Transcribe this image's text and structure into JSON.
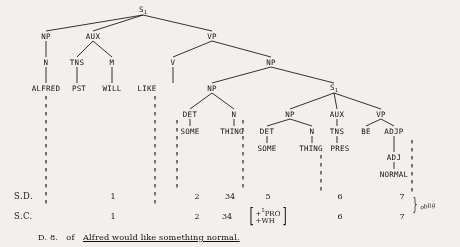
{
  "document": {
    "caption_prefix": "D. 8.",
    "caption_connector": "of",
    "caption_sentence": "Alfred would like something normal.",
    "page_bg": "#f2f0ec",
    "ink": "#15120f"
  },
  "tree": {
    "root_label": "S",
    "root_subscript": "1",
    "nodes": [
      {
        "id": "S_top",
        "label": "S",
        "sub": "1",
        "x": 143,
        "y": 10
      },
      {
        "id": "NP_subj",
        "label": "NP",
        "sub": "",
        "x": 46,
        "y": 36
      },
      {
        "id": "AUX_main",
        "label": "AUX",
        "sub": "",
        "x": 93,
        "y": 36
      },
      {
        "id": "VP_main",
        "label": "VP",
        "sub": "",
        "x": 212,
        "y": 36
      },
      {
        "id": "N_subj",
        "label": "N",
        "sub": "",
        "x": 46,
        "y": 62
      },
      {
        "id": "TNS_main",
        "label": "TNS",
        "sub": "",
        "x": 77,
        "y": 62
      },
      {
        "id": "M_main",
        "label": "M",
        "sub": "",
        "x": 112,
        "y": 62
      },
      {
        "id": "V_main",
        "label": "V",
        "sub": "",
        "x": 173,
        "y": 62
      },
      {
        "id": "NP_obj",
        "label": "NP",
        "sub": "",
        "x": 271,
        "y": 62
      },
      {
        "id": "NP_inner",
        "label": "NP",
        "sub": "",
        "x": 212,
        "y": 88
      },
      {
        "id": "S_emb",
        "label": "S",
        "sub": "1",
        "x": 334,
        "y": 88
      },
      {
        "id": "DET_1",
        "label": "DET",
        "sub": "",
        "x": 190,
        "y": 114
      },
      {
        "id": "N_1",
        "label": "N",
        "sub": "",
        "x": 234,
        "y": 114
      },
      {
        "id": "NP_emb",
        "label": "NP",
        "sub": "",
        "x": 290,
        "y": 114
      },
      {
        "id": "AUX_emb",
        "label": "AUX",
        "sub": "",
        "x": 337,
        "y": 114
      },
      {
        "id": "VP_emb",
        "label": "VP",
        "sub": "",
        "x": 381,
        "y": 114
      },
      {
        "id": "DET_2",
        "label": "DET",
        "sub": "",
        "x": 267,
        "y": 131
      },
      {
        "id": "N_2",
        "label": "N",
        "sub": "",
        "x": 312,
        "y": 131
      },
      {
        "id": "TNS_emb",
        "label": "TNS",
        "sub": "",
        "x": 337,
        "y": 131
      },
      {
        "id": "BE_emb",
        "label": "BE",
        "sub": "",
        "x": 366,
        "y": 131
      },
      {
        "id": "ADJP_emb",
        "label": "ADJP",
        "sub": "",
        "x": 394,
        "y": 131
      },
      {
        "id": "ADJ_emb",
        "label": "ADJ",
        "sub": "",
        "x": 394,
        "y": 157
      }
    ],
    "edges": [
      [
        "S_top",
        "NP_subj"
      ],
      [
        "S_top",
        "AUX_main"
      ],
      [
        "S_top",
        "VP_main"
      ],
      [
        "NP_subj",
        "N_subj"
      ],
      [
        "AUX_main",
        "TNS_main"
      ],
      [
        "AUX_main",
        "M_main"
      ],
      [
        "VP_main",
        "V_main"
      ],
      [
        "VP_main",
        "NP_obj"
      ],
      [
        "NP_obj",
        "NP_inner"
      ],
      [
        "NP_obj",
        "S_emb"
      ],
      [
        "NP_inner",
        "DET_1"
      ],
      [
        "NP_inner",
        "N_1"
      ],
      [
        "S_emb",
        "NP_emb"
      ],
      [
        "S_emb",
        "AUX_emb"
      ],
      [
        "S_emb",
        "VP_emb"
      ],
      [
        "NP_emb",
        "DET_2"
      ],
      [
        "NP_emb",
        "N_2"
      ],
      [
        "AUX_emb",
        "TNS_emb"
      ],
      [
        "VP_emb",
        "BE_emb"
      ],
      [
        "VP_emb",
        "ADJP_emb"
      ],
      [
        "ADJP_emb",
        "ADJ_emb"
      ]
    ],
    "terminals": [
      {
        "id": "t_alfred",
        "label": "ALFRED",
        "x": 46,
        "y": 88,
        "parent": "N_subj"
      },
      {
        "id": "t_pst",
        "label": "PST",
        "x": 79,
        "y": 88,
        "parent": "TNS_main"
      },
      {
        "id": "t_will",
        "label": "WILL",
        "x": 112,
        "y": 88,
        "parent": "M_main"
      },
      {
        "id": "t_like",
        "label": "LIKE",
        "x": 147,
        "y": 88,
        "parent": "V_main"
      },
      {
        "id": "t_some1",
        "label": "SOME",
        "x": 190,
        "y": 131,
        "parent": "DET_1"
      },
      {
        "id": "t_thing1",
        "label": "THING",
        "x": 232,
        "y": 131,
        "parent": "N_1"
      },
      {
        "id": "t_some2",
        "label": "SOME",
        "x": 267,
        "y": 148,
        "parent": "DET_2"
      },
      {
        "id": "t_thing2",
        "label": "THING",
        "x": 311,
        "y": 148,
        "parent": "N_2"
      },
      {
        "id": "t_pres",
        "label": "PRES",
        "x": 340,
        "y": 148,
        "parent": "TNS_emb"
      },
      {
        "id": "t_normal",
        "label": "NORMAL",
        "x": 394,
        "y": 174,
        "parent": "ADJ_emb"
      }
    ]
  },
  "analysis": {
    "sd": {
      "label": "S.D.",
      "label_x": 14,
      "y": 196,
      "cells": [
        {
          "id": "sd_1",
          "text": "1",
          "x": 113
        },
        {
          "id": "sd_2",
          "text": "2",
          "x": 197
        },
        {
          "id": "sd_34",
          "text": "34",
          "x": 230
        },
        {
          "id": "sd_5",
          "text": "5",
          "x": 268
        },
        {
          "id": "sd_6",
          "text": "6",
          "x": 340
        },
        {
          "id": "sd_7",
          "text": "7",
          "x": 402
        }
      ]
    },
    "sc": {
      "label": "S.C.",
      "label_x": 14,
      "y": 216,
      "cells": [
        {
          "id": "sc_1",
          "text": "1",
          "x": 113
        },
        {
          "id": "sc_2",
          "text": "2",
          "x": 197
        },
        {
          "id": "sc_34",
          "text": "34",
          "x": 227
        },
        {
          "id": "sc_6",
          "text": "6",
          "x": 340
        },
        {
          "id": "sc_7",
          "text": "7",
          "x": 402
        }
      ],
      "feature_matrix": {
        "x": 268,
        "y": 216,
        "rows": [
          "+PRO",
          "+WH"
        ],
        "superscript": "5"
      }
    },
    "oblig_label": "oblig"
  },
  "dashed_columns": [
    {
      "id": "dash_alfred",
      "x": 46,
      "y1": 96,
      "y2": 206
    },
    {
      "id": "dash_like",
      "x": 155,
      "y1": 96,
      "y2": 206
    },
    {
      "id": "dash_some1",
      "x": 177,
      "y1": 120,
      "y2": 192
    },
    {
      "id": "dash_det2",
      "x": 243,
      "y1": 120,
      "y2": 192
    },
    {
      "id": "dash_pres",
      "x": 321,
      "y1": 155,
      "y2": 192
    },
    {
      "id": "dash_adjp",
      "x": 412,
      "y1": 140,
      "y2": 192
    }
  ]
}
